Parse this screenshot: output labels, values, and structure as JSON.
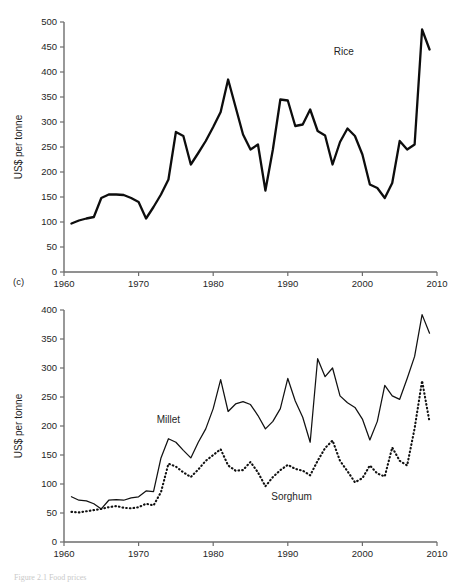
{
  "figure": {
    "panel_letter": "(c)",
    "caption": "Figure 2.1  Food prices"
  },
  "chart_data": [
    {
      "id": "rice",
      "type": "line",
      "title": "",
      "xlabel": "",
      "ylabel": "US$ per tonne",
      "xlim": [
        1960,
        2010
      ],
      "ylim": [
        0,
        500
      ],
      "xticks": [
        1960,
        1970,
        1980,
        1990,
        2000,
        2010
      ],
      "yticks": [
        0,
        50,
        100,
        150,
        200,
        250,
        300,
        350,
        400,
        450,
        500
      ],
      "grid": false,
      "legend_position": "inline-annotation",
      "annotations": [
        {
          "text": "Rice",
          "x": 1997.5,
          "y": 435
        }
      ],
      "series": [
        {
          "name": "Rice",
          "style": "solid",
          "x": [
            1961,
            1962,
            1963,
            1964,
            1965,
            1966,
            1967,
            1968,
            1969,
            1970,
            1971,
            1972,
            1973,
            1974,
            1975,
            1976,
            1977,
            1978,
            1979,
            1980,
            1981,
            1982,
            1983,
            1984,
            1985,
            1986,
            1987,
            1988,
            1989,
            1990,
            1991,
            1992,
            1993,
            1994,
            1995,
            1996,
            1997,
            1998,
            1999,
            2000,
            2001,
            2002,
            2003,
            2004,
            2005,
            2006,
            2007,
            2008,
            2009
          ],
          "values": [
            97,
            103,
            107,
            110,
            148,
            155,
            155,
            154,
            148,
            140,
            107,
            130,
            155,
            185,
            280,
            272,
            215,
            238,
            262,
            290,
            320,
            385,
            330,
            275,
            245,
            255,
            163,
            245,
            345,
            343,
            292,
            295,
            325,
            282,
            273,
            215,
            260,
            287,
            272,
            235,
            175,
            168,
            148,
            178,
            262,
            245,
            255,
            485,
            445
          ]
        }
      ]
    },
    {
      "id": "millet-sorghum",
      "type": "line",
      "title": "",
      "xlabel": "",
      "ylabel": "US$ per tonne",
      "xlim": [
        1960,
        2010
      ],
      "ylim": [
        0,
        400
      ],
      "xticks": [
        1960,
        1970,
        1980,
        1990,
        2000,
        2010
      ],
      "yticks": [
        0,
        50,
        100,
        150,
        200,
        250,
        300,
        350,
        400
      ],
      "grid": false,
      "legend_position": "inline-annotation",
      "annotations": [
        {
          "text": "Millet",
          "x": 1974.0,
          "y": 205
        },
        {
          "text": "Sorghum",
          "x": 1990.5,
          "y": 72
        }
      ],
      "series": [
        {
          "name": "Millet",
          "style": "solid",
          "x": [
            1961,
            1962,
            1963,
            1964,
            1965,
            1966,
            1967,
            1968,
            1969,
            1970,
            1971,
            1972,
            1973,
            1974,
            1975,
            1976,
            1977,
            1978,
            1979,
            1980,
            1981,
            1982,
            1983,
            1984,
            1985,
            1986,
            1987,
            1988,
            1989,
            1990,
            1991,
            1992,
            1993,
            1994,
            1995,
            1996,
            1997,
            1998,
            1999,
            2000,
            2001,
            2002,
            2003,
            2004,
            2005,
            2006,
            2007,
            2008,
            2009
          ],
          "values": [
            78,
            72,
            71,
            66,
            57,
            72,
            73,
            72,
            76,
            78,
            88,
            87,
            145,
            178,
            172,
            158,
            145,
            172,
            195,
            230,
            280,
            225,
            238,
            242,
            237,
            218,
            195,
            208,
            230,
            282,
            243,
            215,
            172,
            316,
            285,
            300,
            252,
            240,
            232,
            212,
            176,
            208,
            270,
            252,
            246,
            282,
            320,
            392,
            360
          ]
        },
        {
          "name": "Sorghum",
          "style": "dotted",
          "x": [
            1961,
            1962,
            1963,
            1964,
            1965,
            1966,
            1967,
            1968,
            1969,
            1970,
            1971,
            1972,
            1973,
            1974,
            1975,
            1976,
            1977,
            1978,
            1979,
            1980,
            1981,
            1982,
            1983,
            1984,
            1985,
            1986,
            1987,
            1988,
            1989,
            1990,
            1991,
            1992,
            1993,
            1994,
            1995,
            1996,
            1997,
            1998,
            1999,
            2000,
            2001,
            2002,
            2003,
            2004,
            2005,
            2006,
            2007,
            2008,
            2009
          ],
          "values": [
            52,
            51,
            53,
            55,
            57,
            60,
            62,
            59,
            58,
            60,
            66,
            63,
            86,
            135,
            130,
            120,
            112,
            125,
            140,
            150,
            160,
            132,
            123,
            124,
            138,
            120,
            96,
            112,
            124,
            133,
            126,
            123,
            115,
            140,
            162,
            175,
            140,
            122,
            103,
            110,
            132,
            118,
            113,
            163,
            140,
            132,
            196,
            278,
            207
          ]
        }
      ]
    }
  ]
}
